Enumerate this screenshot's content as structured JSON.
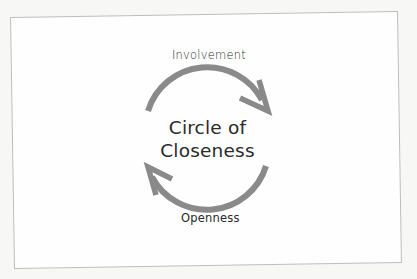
{
  "diagram": {
    "title_line1": "Circle of",
    "title_line2": "Closeness",
    "top_label": "Involvement",
    "bottom_label": "Openness",
    "arrows": [
      {
        "name": "top-arc-arrow",
        "direction": "clockwise",
        "from": "left",
        "to": "right"
      },
      {
        "name": "bottom-arc-arrow",
        "direction": "clockwise",
        "from": "right",
        "to": "left"
      }
    ],
    "colors": {
      "arrow": "#8a8a8a",
      "text": "#2a2a2a",
      "frame_border": "#bdbdbb",
      "background": "#fefefe"
    }
  }
}
